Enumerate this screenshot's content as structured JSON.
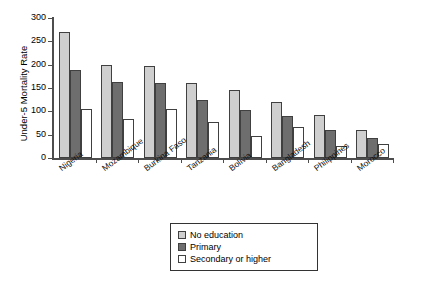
{
  "chart_data": {
    "type": "bar",
    "title": "",
    "xlabel": "",
    "ylabel": "Under-5 Mortality Rate",
    "ylim": [
      0,
      300
    ],
    "yticks": [
      0,
      50,
      100,
      150,
      200,
      250,
      300
    ],
    "grid": false,
    "legend_position": "bottom-center",
    "categories": [
      "Nigeria",
      "Mozambique",
      "Burkina Faso",
      "Tanzania",
      "Bolivia",
      "Bangladesh",
      "Philippines",
      "Morocco"
    ],
    "series": [
      {
        "name": "No education",
        "color": "#cfcfcf",
        "values": [
          270,
          200,
          198,
          161,
          145,
          119,
          92,
          60
        ]
      },
      {
        "name": "Primary",
        "color": "#6e6e6e",
        "values": [
          188,
          163,
          160,
          124,
          102,
          90,
          61,
          43
        ]
      },
      {
        "name": "Secondary or higher",
        "color": "#ffffff",
        "values": [
          106,
          84,
          105,
          77,
          47,
          66,
          26,
          30
        ]
      }
    ]
  },
  "legend": {
    "items": [
      {
        "label": "No education",
        "color": "#cfcfcf"
      },
      {
        "label": "Primary",
        "color": "#6e6e6e"
      },
      {
        "label": "Secondary or higher",
        "color": "#ffffff"
      }
    ]
  }
}
